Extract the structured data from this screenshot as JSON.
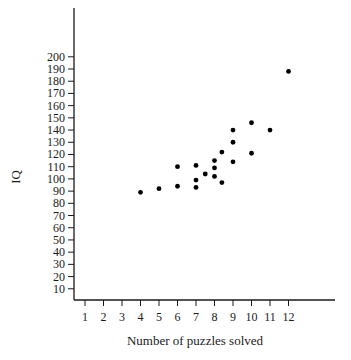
{
  "chart_data": {
    "type": "scatter",
    "title": "",
    "xlabel": "Number of puzzles solved",
    "ylabel": "IQ",
    "xlim": [
      0,
      14
    ],
    "ylim": [
      0,
      240
    ],
    "x_ticks": [
      1,
      2,
      3,
      4,
      5,
      6,
      7,
      8,
      9,
      10,
      11,
      12
    ],
    "y_ticks": [
      10,
      20,
      30,
      40,
      50,
      60,
      70,
      80,
      90,
      100,
      110,
      120,
      130,
      140,
      150,
      160,
      170,
      180,
      190,
      200
    ],
    "grid": false,
    "legend": null,
    "points": [
      {
        "x": 4,
        "y": 89
      },
      {
        "x": 5,
        "y": 92
      },
      {
        "x": 6,
        "y": 94
      },
      {
        "x": 6,
        "y": 110
      },
      {
        "x": 7,
        "y": 111
      },
      {
        "x": 7,
        "y": 99
      },
      {
        "x": 7,
        "y": 93
      },
      {
        "x": 7.5,
        "y": 104
      },
      {
        "x": 8,
        "y": 115
      },
      {
        "x": 8,
        "y": 109
      },
      {
        "x": 8,
        "y": 102
      },
      {
        "x": 8.4,
        "y": 122
      },
      {
        "x": 8.4,
        "y": 97
      },
      {
        "x": 9,
        "y": 140
      },
      {
        "x": 9,
        "y": 130
      },
      {
        "x": 9,
        "y": 114
      },
      {
        "x": 10,
        "y": 146
      },
      {
        "x": 10,
        "y": 121
      },
      {
        "x": 11,
        "y": 140
      },
      {
        "x": 12,
        "y": 188
      }
    ],
    "point_color": "#000000"
  },
  "layout": {
    "x_axis": {
      "px_start": 74,
      "px_end": 335,
      "y_px": 300,
      "origin_px": 66.5,
      "px_per_unit": 18.5
    },
    "y_axis": {
      "px_top": 8,
      "px_bottom": 300,
      "x_px": 74,
      "zero_px": 301,
      "px_per_unit": 1.221
    }
  }
}
